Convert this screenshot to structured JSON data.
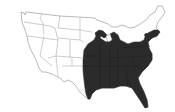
{
  "map": {
    "title": "United States range map",
    "region_description": "Eastern United States shaded",
    "colors": {
      "background": "#ffffff",
      "unshaded_fill": "#ffffff",
      "shaded_fill": "#2b2b2b",
      "outline": "#8a8a8a"
    },
    "shaded_states": [
      "Minnesota (southeast)",
      "Wisconsin",
      "Iowa",
      "Missouri",
      "Arkansas",
      "Louisiana",
      "Illinois",
      "Indiana",
      "Michigan",
      "Ohio",
      "Kentucky",
      "Tennessee",
      "Mississippi",
      "Alabama",
      "Georgia",
      "Florida",
      "South Carolina",
      "North Carolina",
      "Virginia",
      "West Virginia",
      "Maryland",
      "Delaware",
      "Pennsylvania",
      "New Jersey",
      "New York",
      "Connecticut",
      "Rhode Island",
      "Massachusetts",
      "Eastern Texas",
      "Eastern Oklahoma",
      "Eastern Kansas",
      "Eastern Nebraska"
    ],
    "unshaded_states": [
      "Washington",
      "Oregon",
      "California",
      "Nevada",
      "Idaho",
      "Montana",
      "Wyoming",
      "Utah",
      "Arizona",
      "Colorado",
      "New Mexico",
      "North Dakota",
      "South Dakota",
      "Vermont",
      "New Hampshire",
      "Maine"
    ]
  }
}
